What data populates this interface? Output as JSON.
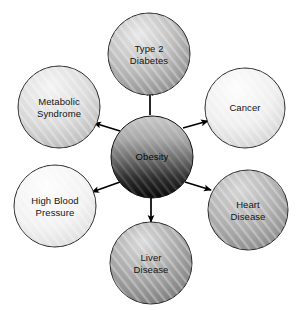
{
  "diagram": {
    "type": "radial-hub-and-spoke",
    "canvas": {
      "width": 301,
      "height": 310,
      "background": "#ffffff"
    },
    "center_node": {
      "id": "obesity",
      "label": "Obesity",
      "cx": 152,
      "cy": 157,
      "r": 41,
      "fill_top": "#c9c9c9",
      "fill_bottom": "#080808",
      "stroke": "#101010",
      "text_color": "#0a0a0a"
    },
    "nodes": [
      {
        "id": "type-2-diabetes",
        "label": "Type 2\nDiabetes",
        "cx": 149,
        "cy": 54,
        "r": 41,
        "fill_light": "#e3e3e3",
        "fill_dark": "#8e8e8e",
        "stroke": "#2a2a2a",
        "text_color": "#141414"
      },
      {
        "id": "cancer",
        "label": "Cancer",
        "cx": 245,
        "cy": 108,
        "r": 40,
        "fill_light": "#fbfbfb",
        "fill_dark": "#d2d2d2",
        "stroke": "#2a2a2a",
        "text_color": "#141414"
      },
      {
        "id": "heart-disease",
        "label": "Heart\nDisease",
        "cx": 248,
        "cy": 210,
        "r": 40,
        "fill_light": "#cfcfcf",
        "fill_dark": "#8a8a8a",
        "stroke": "#2a2a2a",
        "text_color": "#141414"
      },
      {
        "id": "liver-disease",
        "label": "Liver\nDisease",
        "cx": 151,
        "cy": 263,
        "r": 41,
        "fill_light": "#d5d5d5",
        "fill_dark": "#7e7e7e",
        "stroke": "#2a2a2a",
        "text_color": "#141414"
      },
      {
        "id": "high-blood-pressure",
        "label": "High Blood\nPressure",
        "cx": 55,
        "cy": 206,
        "r": 41,
        "fill_light": "#fcfcfc",
        "fill_dark": "#dedede",
        "stroke": "#2a2a2a",
        "text_color": "#141414"
      },
      {
        "id": "metabolic-syndrome",
        "label": "Metabolic\nSyndrome",
        "cx": 59,
        "cy": 107,
        "r": 41,
        "fill_light": "#efefef",
        "fill_dark": "#b8b8b8",
        "stroke": "#2a2a2a",
        "text_color": "#141414"
      }
    ],
    "arrows": [
      {
        "id": "arrow-to-type-2-diabetes",
        "from": "obesity",
        "to": "type-2-diabetes",
        "direction": "up",
        "color": "#000000"
      },
      {
        "id": "arrow-to-cancer",
        "from": "obesity",
        "to": "cancer",
        "direction": "up-right",
        "color": "#000000"
      },
      {
        "id": "arrow-to-heart-disease",
        "from": "obesity",
        "to": "heart-disease",
        "direction": "down-right",
        "color": "#000000"
      },
      {
        "id": "arrow-to-liver-disease",
        "from": "obesity",
        "to": "liver-disease",
        "direction": "down",
        "color": "#000000"
      },
      {
        "id": "arrow-to-high-blood-pressure",
        "from": "obesity",
        "to": "high-blood-pressure",
        "direction": "down-left",
        "color": "#000000"
      },
      {
        "id": "arrow-to-metabolic-syndrome",
        "from": "obesity",
        "to": "metabolic-syndrome",
        "direction": "up-left",
        "color": "#000000"
      }
    ]
  }
}
